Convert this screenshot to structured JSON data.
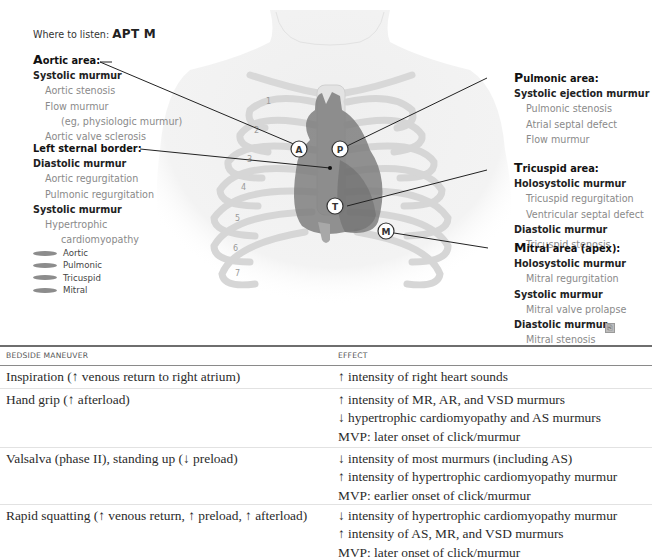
{
  "figure": {
    "where_label": "Where to listen:",
    "where_mnemonic": "APT M",
    "markers": {
      "aortic": "A",
      "pulmonic": "P",
      "tricuspid": "T",
      "mitral": "M"
    },
    "rib_numbers": [
      "1",
      "2",
      "3",
      "4",
      "5",
      "6",
      "7"
    ],
    "aortic_area": {
      "cap": "A",
      "title": "ortic area:",
      "groups": [
        {
          "type": "Systolic murmur",
          "items": [
            "Aortic stenosis",
            "Flow murmur",
            "(eg, physiologic murmur)",
            "Aortic valve sclerosis"
          ]
        }
      ]
    },
    "left_sternal_border": {
      "title": "Left sternal border:",
      "groups": [
        {
          "type": "Diastolic murmur",
          "items": [
            "Aortic regurgitation",
            "Pulmonic regurgitation"
          ]
        },
        {
          "type": "Systolic murmur",
          "items": [
            "Hypertrophic",
            "cardiomyopathy"
          ]
        }
      ]
    },
    "pulmonic_area": {
      "cap": "P",
      "title": "ulmonic area:",
      "groups": [
        {
          "type": "Systolic ejection murmur",
          "items": [
            "Pulmonic stenosis",
            "Atrial septal defect",
            "Flow murmur"
          ]
        }
      ]
    },
    "tricuspid_area": {
      "cap": "T",
      "title": "ricuspid area:",
      "groups": [
        {
          "type": "Holosystolic murmur",
          "items": [
            "Tricuspid regurgitation",
            "Ventricular septal defect"
          ]
        },
        {
          "type": "Diastolic murmur",
          "items": [
            "Tricuspid stenosis"
          ]
        }
      ]
    },
    "mitral_area": {
      "cap": "M",
      "title": "itral area (apex):",
      "groups": [
        {
          "type": "Holosystolic murmur",
          "items": [
            "Mitral regurgitation"
          ]
        },
        {
          "type": "Systolic murmur",
          "items": [
            "Mitral valve prolapse"
          ]
        },
        {
          "type": "Diastolic murmur",
          "items": [
            "Mitral stenosis"
          ]
        }
      ]
    },
    "legend": [
      "Aortic",
      "Pulmonic",
      "Tricuspid",
      "Mitral"
    ],
    "legend_color": "#8c8c8c",
    "copy_icon": "⎘"
  },
  "table": {
    "headers": [
      "BEDSIDE MANEUVER",
      "EFFECT"
    ],
    "rows": [
      {
        "maneuver": "Inspiration (↑ venous return to right atrium)",
        "effects": [
          "↑ intensity of right heart sounds"
        ]
      },
      {
        "maneuver": "Hand grip (↑ afterload)",
        "effects": [
          "↑ intensity of MR, AR, and VSD murmurs",
          "↓ hypertrophic cardiomyopathy and AS murmurs",
          "MVP: later onset of click/murmur"
        ]
      },
      {
        "maneuver": "Valsalva (phase II), standing up (↓ preload)",
        "effects": [
          "↓ intensity of most murmurs (including AS)",
          "↑ intensity of hypertrophic cardiomyopathy murmur",
          "MVP: earlier onset of click/murmur"
        ]
      },
      {
        "maneuver": "Rapid squatting (↑ venous return, ↑ preload, ↑ afterload)",
        "effects": [
          "↓ intensity of hypertrophic cardiomyopathy murmur",
          "↑ intensity of AS, MR, and VSD murmurs",
          "MVP: later onset of click/murmur"
        ]
      }
    ]
  }
}
